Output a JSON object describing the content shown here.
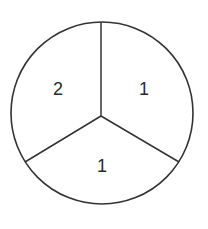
{
  "diagram": {
    "type": "spinner",
    "sector_count": 3,
    "stroke_color": "#333333",
    "background": "#ffffff",
    "sectors": [
      {
        "position": "upper-left",
        "label": "2"
      },
      {
        "position": "upper-right",
        "label": "1"
      },
      {
        "position": "bottom",
        "label": "1"
      }
    ]
  }
}
